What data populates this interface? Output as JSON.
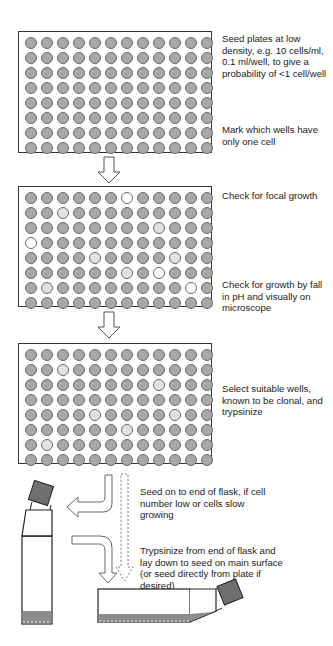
{
  "diagram": {
    "plate_layout": {
      "rows": 8,
      "columns": 12
    },
    "colors": {
      "well_fill": "#a8a8a8",
      "well_light": "#e2e2e2",
      "well_white": "#ffffff",
      "outline": "#333333",
      "cap_fill": "#6f6f6f",
      "medium_fill": "#8c8c8c"
    },
    "steps": [
      {
        "id": "plate-1",
        "annotations": [
          "Seed plates at low density, e.g. 10 cells/ml, 0.1 ml/well, to give a probability of <1 cell/well",
          "Mark which wells have only one cell"
        ],
        "highlighted_wells": []
      },
      {
        "id": "plate-2",
        "annotations": [
          "Check for focal growth",
          "Check for growth by fall in pH and visually on microscope"
        ],
        "highlighted_wells": [
          {
            "row": 0,
            "col": 6,
            "shade": "white"
          },
          {
            "row": 1,
            "col": 2,
            "shade": "light"
          },
          {
            "row": 2,
            "col": 8,
            "shade": "light"
          },
          {
            "row": 3,
            "col": 0,
            "shade": "white"
          },
          {
            "row": 4,
            "col": 4,
            "shade": "light"
          },
          {
            "row": 4,
            "col": 9,
            "shade": "light"
          },
          {
            "row": 5,
            "col": 6,
            "shade": "light"
          },
          {
            "row": 5,
            "col": 8,
            "shade": "white"
          },
          {
            "row": 6,
            "col": 1,
            "shade": "light"
          },
          {
            "row": 6,
            "col": 10,
            "shade": "white"
          }
        ]
      },
      {
        "id": "plate-3",
        "annotations": [
          "Select suitable wells, known to be clonal, and trypsinize"
        ],
        "highlighted_wells": [
          {
            "row": 1,
            "col": 2,
            "shade": "light"
          },
          {
            "row": 2,
            "col": 8,
            "shade": "light"
          },
          {
            "row": 4,
            "col": 4,
            "shade": "light"
          },
          {
            "row": 4,
            "col": 9,
            "shade": "light"
          },
          {
            "row": 5,
            "col": 6,
            "shade": "light"
          },
          {
            "row": 6,
            "col": 1,
            "shade": "light"
          }
        ]
      }
    ],
    "flask_steps": {
      "seed_end": "Seed on to end of flask, if cell number low or cells slow growing",
      "trypsinize": "Trypsinize from end of flask and lay down to seed on main surface (or seed directly from plate if desired)"
    },
    "icons": [
      "down-arrow-icon",
      "bent-arrow-left-icon",
      "bent-arrow-down-icon",
      "dashed-arrow-down-icon",
      "upright-flask-icon",
      "flat-flask-icon"
    ]
  }
}
